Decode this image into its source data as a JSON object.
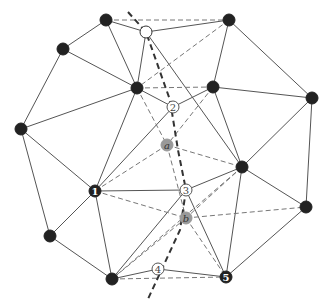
{
  "diagram": {
    "title": "",
    "colors": {
      "background": "#ffffff",
      "edge": "#555555",
      "dashed_edge": "#777777",
      "path": "#333333",
      "node_fill": "#222222",
      "open_node_fill": "#ffffff",
      "gray_node_fill": "#999999"
    },
    "nodes": [
      {
        "id": "n_top_left",
        "x": 106,
        "y": 20,
        "type": "filled",
        "label": ""
      },
      {
        "id": "n_top_open",
        "x": 146,
        "y": 32,
        "type": "open",
        "label": ""
      },
      {
        "id": "n_top_right",
        "x": 229,
        "y": 20,
        "type": "filled",
        "label": ""
      },
      {
        "id": "n_left_upper",
        "x": 63,
        "y": 49,
        "type": "filled",
        "label": ""
      },
      {
        "id": "n_center_left",
        "x": 137,
        "y": 88,
        "type": "filled",
        "label": ""
      },
      {
        "id": "n_center_right",
        "x": 213,
        "y": 87,
        "type": "filled",
        "label": ""
      },
      {
        "id": "n_right",
        "x": 312,
        "y": 98,
        "type": "filled",
        "label": ""
      },
      {
        "id": "n_left",
        "x": 21,
        "y": 129,
        "type": "filled",
        "label": ""
      },
      {
        "id": "n_2",
        "x": 173,
        "y": 107,
        "type": "open-numbered",
        "label": "2"
      },
      {
        "id": "n_a",
        "x": 167,
        "y": 145,
        "type": "gray",
        "label": "a"
      },
      {
        "id": "n_mid_right",
        "x": 242,
        "y": 167,
        "type": "filled",
        "label": ""
      },
      {
        "id": "n_1",
        "x": 95,
        "y": 191,
        "type": "filled-numbered",
        "label": "1"
      },
      {
        "id": "n_3",
        "x": 186,
        "y": 190,
        "type": "open-numbered",
        "label": "3"
      },
      {
        "id": "n_lower_right",
        "x": 306,
        "y": 207,
        "type": "filled",
        "label": ""
      },
      {
        "id": "n_b",
        "x": 186,
        "y": 218,
        "type": "gray",
        "label": "b"
      },
      {
        "id": "n_lower_left",
        "x": 50,
        "y": 236,
        "type": "filled",
        "label": ""
      },
      {
        "id": "n_4",
        "x": 158,
        "y": 269,
        "type": "open-numbered",
        "label": "4"
      },
      {
        "id": "n_bottom",
        "x": 112,
        "y": 279,
        "type": "filled",
        "label": ""
      },
      {
        "id": "n_5",
        "x": 226,
        "y": 277,
        "type": "filled-numbered",
        "label": "5"
      }
    ],
    "solid_edges": [
      [
        "n_top_left",
        "n_left_upper"
      ],
      [
        "n_top_left",
        "n_center_left"
      ],
      [
        "n_top_left",
        "n_top_open"
      ],
      [
        "n_top_open",
        "n_top_right"
      ],
      [
        "n_top_open",
        "n_center_left"
      ],
      [
        "n_top_open",
        "n_mid_right"
      ],
      [
        "n_top_right",
        "n_center_right"
      ],
      [
        "n_top_right",
        "n_right"
      ],
      [
        "n_left_upper",
        "n_left"
      ],
      [
        "n_left_upper",
        "n_center_left"
      ],
      [
        "n_left",
        "n_center_left"
      ],
      [
        "n_left",
        "n_1"
      ],
      [
        "n_left",
        "n_lower_left"
      ],
      [
        "n_center_left",
        "n_2"
      ],
      [
        "n_center_left",
        "n_1"
      ],
      [
        "n_center_right",
        "n_2"
      ],
      [
        "n_center_right",
        "n_right"
      ],
      [
        "n_center_right",
        "n_mid_right"
      ],
      [
        "n_right",
        "n_mid_right"
      ],
      [
        "n_right",
        "n_lower_right"
      ],
      [
        "n_2",
        "n_1"
      ],
      [
        "n_mid_right",
        "n_3"
      ],
      [
        "n_mid_right",
        "n_lower_right"
      ],
      [
        "n_mid_right",
        "n_5"
      ],
      [
        "n_1",
        "n_3"
      ],
      [
        "n_1",
        "n_lower_left"
      ],
      [
        "n_1",
        "n_bottom"
      ],
      [
        "n_3",
        "n_bottom"
      ],
      [
        "n_3",
        "n_5"
      ],
      [
        "n_lower_right",
        "n_5"
      ],
      [
        "n_lower_left",
        "n_bottom"
      ],
      [
        "n_bottom",
        "n_4"
      ],
      [
        "n_4",
        "n_5"
      ]
    ],
    "dashed_edges": [
      [
        "n_top_left",
        "n_top_right"
      ],
      [
        "n_top_right",
        "n_center_left"
      ],
      [
        "n_center_left",
        "n_center_right"
      ],
      [
        "n_center_left",
        "n_a"
      ],
      [
        "n_center_right",
        "n_a"
      ],
      [
        "n_a",
        "n_1"
      ],
      [
        "n_a",
        "n_mid_right"
      ],
      [
        "n_a",
        "n_b"
      ],
      [
        "n_1",
        "n_b"
      ],
      [
        "n_mid_right",
        "n_b"
      ],
      [
        "n_b",
        "n_lower_right"
      ],
      [
        "n_b",
        "n_bottom"
      ],
      [
        "n_b",
        "n_5"
      ],
      [
        "n_mid_right",
        "n_bottom"
      ],
      [
        "n_bottom",
        "n_5"
      ]
    ],
    "thick_path": [
      [
        128,
        12
      ],
      [
        146,
        32
      ],
      [
        170,
        100
      ],
      [
        178,
        150
      ],
      [
        186,
        190
      ],
      [
        180,
        230
      ],
      [
        148,
        299
      ]
    ]
  }
}
